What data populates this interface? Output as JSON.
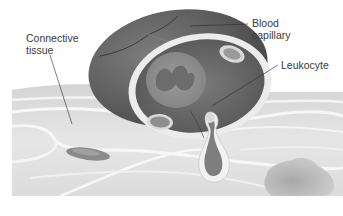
{
  "figure": {
    "labels": {
      "connective_tissue": "Connective\ntissue",
      "blood_capillary": "Blood\ncapillary",
      "leukocyte": "Leukocyte"
    },
    "colors": {
      "background": "#ffffff",
      "capillary_wall": "#5e5e5e",
      "capillary_wall_dark": "#4a4a4a",
      "endothelium": "#ebebeb",
      "lumen": "#6a6a6a",
      "tissue_base": "#e2e2e2",
      "fibers": "#f6f6f6",
      "label_text": "#3a3a3a",
      "leader_line": "#2a2a2a"
    }
  }
}
